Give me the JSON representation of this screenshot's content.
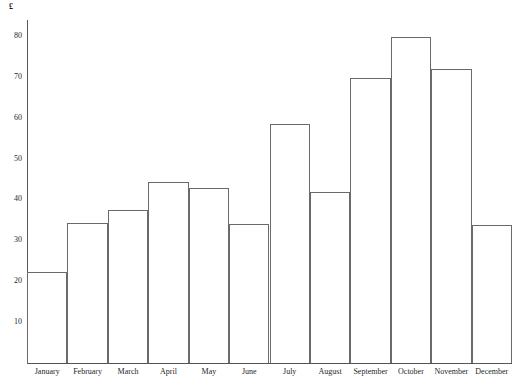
{
  "chart_data": {
    "type": "bar",
    "title": "",
    "subtitle": "",
    "xlabel": "",
    "ylabel": "£",
    "ylim": [
      0,
      83
    ],
    "grid": false,
    "legend": false,
    "categories": [
      "January",
      "February",
      "March",
      "April",
      "May",
      "June",
      "July",
      "August",
      "September",
      "October",
      "November",
      "December"
    ],
    "values": [
      22.3,
      34.3,
      37.4,
      44.3,
      42.8,
      34.0,
      58.5,
      41.8,
      69.8,
      79.8,
      71.8,
      33.8
    ],
    "ytick_labels": [
      "80",
      "70",
      "60",
      "50",
      "40",
      "30",
      "20",
      "10"
    ],
    "ytick_values": [
      80,
      70,
      60,
      50,
      40,
      30,
      20,
      10
    ],
    "currency_symbol": "£",
    "colors": {
      "bar_fill": "#ffffff",
      "bar_stroke": "#6a6a6a",
      "axis": "#565656",
      "text": "#1f1f1f",
      "background": "#ffffff"
    }
  }
}
